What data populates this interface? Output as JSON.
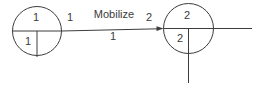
{
  "diagram": {
    "type": "activity-on-arrow-network",
    "activity": {
      "name": "Mobilize",
      "duration": "1",
      "tail_node_label": "1",
      "head_node_label": "2"
    },
    "nodes": [
      {
        "number": "1",
        "earliest_time": "1",
        "latest_time": ""
      },
      {
        "number": "2",
        "earliest_time": "2",
        "latest_time": ""
      }
    ],
    "colors": {
      "line": "#3c3c3c",
      "text": "#3a3a3a",
      "background": "#ffffff"
    }
  }
}
